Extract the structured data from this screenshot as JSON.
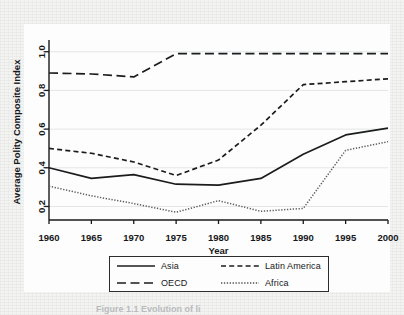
{
  "figure": {
    "caption": "Figure 1.1  Evolution of li"
  },
  "chart_data": {
    "type": "line",
    "title": "",
    "xlabel": "Year",
    "ylabel": "Average Polity Composite Index",
    "x": [
      1960,
      1965,
      1970,
      1975,
      1980,
      1985,
      1990,
      1995,
      2000
    ],
    "xticks": [
      "1960",
      "1965",
      "1970",
      "1975",
      "1980",
      "1985",
      "1990",
      "1995",
      "2000"
    ],
    "yticks": [
      "0.2",
      "0.4",
      "0.6",
      "0.8",
      "1.0"
    ],
    "ytick_values": [
      0.2,
      0.4,
      0.6,
      0.8,
      1.0
    ],
    "xlim": [
      1960,
      2000
    ],
    "ylim": [
      0.13,
      1.04
    ],
    "grid": "horizontal",
    "legend_position": "bottom-center",
    "series": [
      {
        "name": "Asia",
        "style": "solid",
        "color": "#1b1c1e",
        "values": [
          0.4,
          0.345,
          0.365,
          0.315,
          0.31,
          0.345,
          0.47,
          0.57,
          0.605
        ]
      },
      {
        "name": "OECD",
        "style": "long-dash",
        "color": "#1b1c1e",
        "values": [
          0.89,
          0.885,
          0.87,
          0.99,
          0.99,
          0.99,
          0.99,
          0.99,
          0.99
        ]
      },
      {
        "name": "Latin America",
        "style": "short-dash",
        "color": "#1b1c1e",
        "values": [
          0.5,
          0.475,
          0.43,
          0.36,
          0.44,
          0.62,
          0.83,
          0.845,
          0.86
        ]
      },
      {
        "name": "Africa",
        "style": "dotted",
        "color": "#5a5c5e",
        "values": [
          0.305,
          0.255,
          0.215,
          0.17,
          0.23,
          0.175,
          0.19,
          0.49,
          0.535
        ]
      }
    ]
  },
  "legend": {
    "entries": [
      {
        "label": "Asia",
        "style": "solid"
      },
      {
        "label": "Latin America",
        "style": "short-dash"
      },
      {
        "label": "OECD",
        "style": "long-dash"
      },
      {
        "label": "Africa",
        "style": "dotted"
      }
    ]
  }
}
